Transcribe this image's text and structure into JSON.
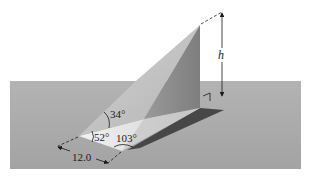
{
  "figure": {
    "type": "geometry-diagram",
    "labels": {
      "height": "h",
      "angle_elevation": "34°",
      "angle_base_left": "52°",
      "angle_base_bottom": "103°",
      "base_length": "12.0"
    },
    "colors": {
      "background": "#ffffff",
      "plane": "#a9a9a9",
      "plane_edge": "#9c9c9c",
      "face_light": "#c4c4c4",
      "face_wall": "#8e8e8e",
      "base_triangle": "#e6e6e6",
      "shadow": "#454545",
      "ink": "#1a1a1a"
    }
  }
}
